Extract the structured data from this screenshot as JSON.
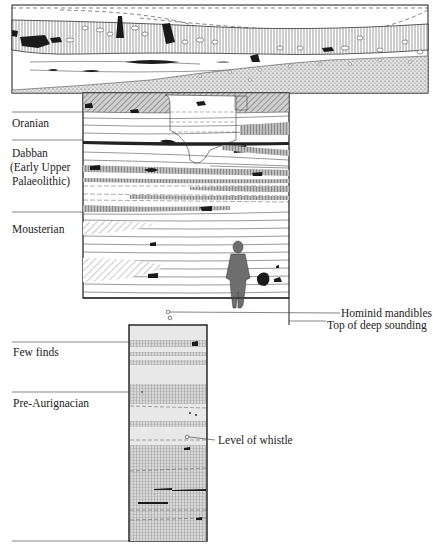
{
  "figure": {
    "type": "archaeological stratigraphic section",
    "colors": {
      "ink": "#1a1a1a",
      "hatch": "#555555",
      "shade_light": "#d8d8d8",
      "shade_mid": "#b5b5b5",
      "figure_fill": "#6e6e6e"
    }
  },
  "left_labels": [
    {
      "id": "oranian",
      "text": "Oranian"
    },
    {
      "id": "dabban-1",
      "text": "Dabban"
    },
    {
      "id": "dabban-2",
      "text": "(Early Upper"
    },
    {
      "id": "dabban-3",
      "text": "Palaeolithic)"
    },
    {
      "id": "mousterian",
      "text": "Mousterian"
    },
    {
      "id": "few-finds",
      "text": "Few finds"
    },
    {
      "id": "pre-aurignacian",
      "text": "Pre-Aurignacian"
    }
  ],
  "right_labels": [
    {
      "id": "hominid-mandibles",
      "text": "Hominid mandibles"
    },
    {
      "id": "top-deep-sounding",
      "text": "Top of deep sounding"
    },
    {
      "id": "level-whistle",
      "text": "Level of whistle"
    }
  ],
  "scale_figure": {
    "description": "human figure for scale",
    "icon": "human-silhouette-icon"
  }
}
